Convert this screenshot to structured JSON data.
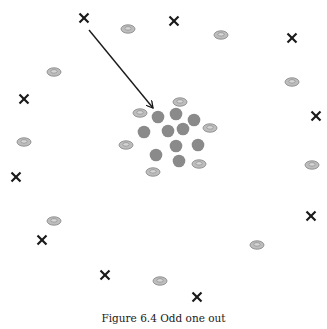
{
  "figure": {
    "caption": "Figure 6.4 Odd one out",
    "colors": {
      "cross": "#1a1a1a",
      "cluster_dot": "#8a8a8a",
      "disc_fill": "#bdbdbd",
      "disc_stroke": "#8c8c8c",
      "arrow": "#1a1a1a"
    },
    "crosses": [
      {
        "x": 84,
        "y": 18
      },
      {
        "x": 174,
        "y": 21
      },
      {
        "x": 292,
        "y": 38
      },
      {
        "x": 24,
        "y": 99
      },
      {
        "x": 316,
        "y": 116
      },
      {
        "x": 16,
        "y": 177
      },
      {
        "x": 311,
        "y": 216
      },
      {
        "x": 42,
        "y": 240
      },
      {
        "x": 105,
        "y": 275
      },
      {
        "x": 197,
        "y": 297
      }
    ],
    "discs": [
      {
        "x": 128,
        "y": 29
      },
      {
        "x": 221,
        "y": 35
      },
      {
        "x": 54,
        "y": 72
      },
      {
        "x": 292,
        "y": 82
      },
      {
        "x": 180,
        "y": 102
      },
      {
        "x": 140,
        "y": 113
      },
      {
        "x": 210,
        "y": 128
      },
      {
        "x": 24,
        "y": 142
      },
      {
        "x": 126,
        "y": 145
      },
      {
        "x": 199,
        "y": 164
      },
      {
        "x": 312,
        "y": 165
      },
      {
        "x": 153,
        "y": 172
      },
      {
        "x": 54,
        "y": 221
      },
      {
        "x": 257,
        "y": 245
      },
      {
        "x": 160,
        "y": 281
      }
    ],
    "cluster_dots": [
      {
        "x": 158,
        "y": 117
      },
      {
        "x": 176,
        "y": 114
      },
      {
        "x": 194,
        "y": 120
      },
      {
        "x": 144,
        "y": 132
      },
      {
        "x": 168,
        "y": 131
      },
      {
        "x": 183,
        "y": 129
      },
      {
        "x": 176,
        "y": 146
      },
      {
        "x": 198,
        "y": 145
      },
      {
        "x": 156,
        "y": 155
      },
      {
        "x": 179,
        "y": 161
      }
    ],
    "arrow": {
      "x1": 89,
      "y1": 30,
      "x2": 153,
      "y2": 108
    }
  }
}
